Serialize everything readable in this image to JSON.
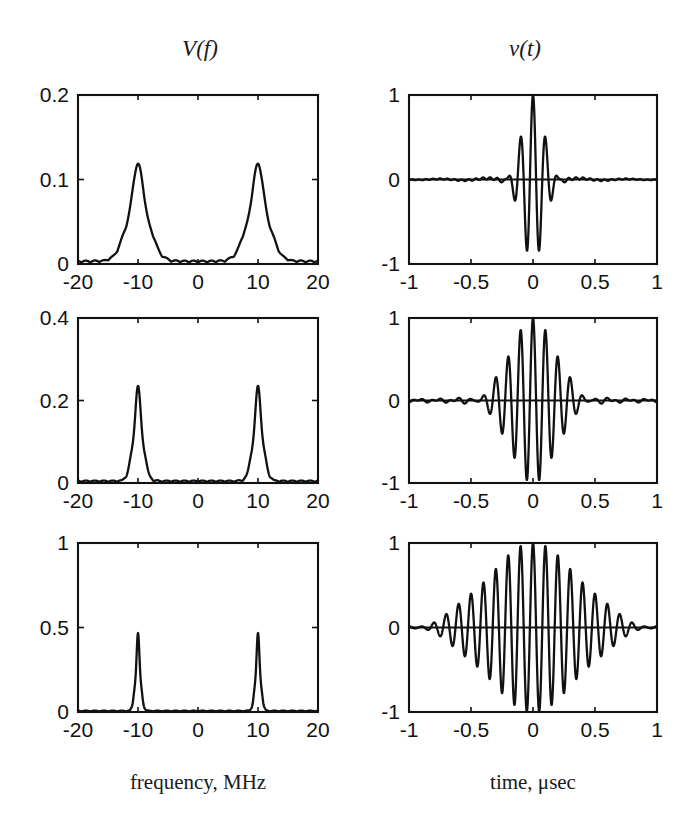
{
  "figure": {
    "columns": [
      {
        "title": "V(f)",
        "axis_caption": "frequency, MHz"
      },
      {
        "title": "v(t)",
        "axis_caption": "time, μsec"
      }
    ]
  },
  "chart_data": [
    {
      "id": "spectrum-row-1",
      "type": "line",
      "title": "V(f)",
      "xlabel": "frequency, MHz",
      "ylabel": "",
      "xlim": [
        -20,
        20
      ],
      "ylim": [
        0,
        0.2
      ],
      "xticks": [
        -20,
        -10,
        0,
        10,
        20
      ],
      "xticklabels": [
        "-20",
        "-10",
        "0",
        "10",
        "20"
      ],
      "yticks": [
        0,
        0.1,
        0.2
      ],
      "yticklabels": [
        "0",
        "0.1",
        "0.2"
      ],
      "grid": false,
      "legend": "none",
      "peak_centers": [
        -10,
        10
      ],
      "peak_height": 0.115,
      "peak_halfwidth_mhz": 2.5,
      "baseline": 0.004
    },
    {
      "id": "waveform-row-1",
      "type": "line",
      "title": "v(t)",
      "xlabel": "time, μsec",
      "ylabel": "",
      "xlim": [
        -1,
        1
      ],
      "ylim": [
        -1,
        1
      ],
      "xticks": [
        -1,
        -0.5,
        0,
        0.5,
        1
      ],
      "xticklabels": [
        "-1",
        "-0.5",
        "0",
        "0.5",
        "1"
      ],
      "yticks": [
        -1,
        0,
        1
      ],
      "yticklabels": [
        "-1",
        "0",
        "1"
      ],
      "grid": false,
      "legend": "none",
      "carrier_mhz": 10,
      "envelope_sigma_usec": 0.085,
      "peak_amplitude": 1.0
    },
    {
      "id": "spectrum-row-2",
      "type": "line",
      "title": "",
      "xlabel": "frequency, MHz",
      "ylabel": "",
      "xlim": [
        -20,
        20
      ],
      "ylim": [
        0,
        0.4
      ],
      "xticks": [
        -20,
        -10,
        0,
        10,
        20
      ],
      "xticklabels": [
        "-20",
        "-10",
        "0",
        "10",
        "20"
      ],
      "yticks": [
        0,
        0.2,
        0.4
      ],
      "yticklabels": [
        "0",
        "0.2",
        "0.4"
      ],
      "grid": false,
      "legend": "none",
      "peak_centers": [
        -10,
        10
      ],
      "peak_height": 0.23,
      "peak_halfwidth_mhz": 1.2,
      "baseline": 0.006
    },
    {
      "id": "waveform-row-2",
      "type": "line",
      "title": "",
      "xlabel": "time, μsec",
      "ylabel": "",
      "xlim": [
        -1,
        1
      ],
      "ylim": [
        -1,
        1
      ],
      "xticks": [
        -1,
        -0.5,
        0,
        0.5,
        1
      ],
      "xticklabels": [
        "-1",
        "-0.5",
        "0",
        "0.5",
        "1"
      ],
      "yticks": [
        -1,
        0,
        1
      ],
      "yticklabels": [
        "-1",
        "0",
        "1"
      ],
      "grid": false,
      "legend": "none",
      "carrier_mhz": 10,
      "envelope_sigma_usec": 0.18,
      "peak_amplitude": 1.0
    },
    {
      "id": "spectrum-row-3",
      "type": "line",
      "title": "",
      "xlabel": "frequency, MHz",
      "ylabel": "",
      "xlim": [
        -20,
        20
      ],
      "ylim": [
        0,
        1
      ],
      "xticks": [
        -20,
        -10,
        0,
        10,
        20
      ],
      "xticklabels": [
        "-20",
        "-10",
        "0",
        "10",
        "20"
      ],
      "yticks": [
        0,
        0.5,
        1
      ],
      "yticklabels": [
        "0",
        "0.5",
        "1"
      ],
      "grid": false,
      "legend": "none",
      "peak_centers": [
        -10,
        10
      ],
      "peak_height": 0.46,
      "peak_halfwidth_mhz": 0.62,
      "baseline": 0.008
    },
    {
      "id": "waveform-row-3",
      "type": "line",
      "title": "",
      "xlabel": "time, μsec",
      "ylabel": "",
      "xlim": [
        -1,
        1
      ],
      "ylim": [
        -1,
        1
      ],
      "xticks": [
        -1,
        -0.5,
        0,
        0.5,
        1
      ],
      "xticklabels": [
        "-1",
        "-0.5",
        "0",
        "0.5",
        "1"
      ],
      "yticks": [
        -1,
        0,
        1
      ],
      "yticklabels": [
        "-1",
        "0",
        "1"
      ],
      "grid": false,
      "legend": "none",
      "carrier_mhz": 10,
      "envelope_sigma_usec": 0.36,
      "peak_amplitude": 1.0
    }
  ],
  "layout": {
    "panels": [
      {
        "chart": 0,
        "x": 78,
        "y": 95,
        "w": 240,
        "h": 169
      },
      {
        "chart": 1,
        "x": 409,
        "y": 95,
        "w": 248,
        "h": 169
      },
      {
        "chart": 2,
        "x": 78,
        "y": 318,
        "w": 240,
        "h": 165
      },
      {
        "chart": 3,
        "x": 409,
        "y": 318,
        "w": 248,
        "h": 165
      },
      {
        "chart": 4,
        "x": 78,
        "y": 543,
        "w": 240,
        "h": 169
      },
      {
        "chart": 5,
        "x": 409,
        "y": 543,
        "w": 248,
        "h": 169
      }
    ]
  },
  "style": {
    "ink": "#111111",
    "background": "#ffffff"
  }
}
